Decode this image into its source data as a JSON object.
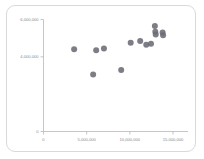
{
  "chart_data": {
    "type": "scatter",
    "title": "",
    "xlabel": "",
    "ylabel": "",
    "xlim": [
      0,
      16500000
    ],
    "ylim": [
      0,
      6000000
    ],
    "grid": false,
    "legend": null,
    "xticks": [
      {
        "value": 0,
        "label": "0"
      },
      {
        "value": 5000000,
        "label": "5,000,000"
      },
      {
        "value": 10000000,
        "label": "10,000,000"
      },
      {
        "value": 15000000,
        "label": "15,000,000"
      }
    ],
    "yticks": [
      {
        "value": 0,
        "label": "0"
      },
      {
        "value": 4000000,
        "label": "4,000,000"
      },
      {
        "value": 6000000,
        "label": "6,000,000"
      }
    ],
    "series": [
      {
        "name": "series-1",
        "marker": "circle",
        "color": "#6b6b75",
        "points": [
          {
            "x": 3550000,
            "y": 4400000
          },
          {
            "x": 6100000,
            "y": 4350000
          },
          {
            "x": 7000000,
            "y": 4450000
          },
          {
            "x": 5750000,
            "y": 3050000
          },
          {
            "x": 9000000,
            "y": 3300000
          },
          {
            "x": 10100000,
            "y": 4750000
          },
          {
            "x": 11200000,
            "y": 4850000
          },
          {
            "x": 11900000,
            "y": 4650000
          },
          {
            "x": 12450000,
            "y": 4700000
          },
          {
            "x": 12900000,
            "y": 5650000
          },
          {
            "x": 12950000,
            "y": 5350000
          },
          {
            "x": 13000000,
            "y": 5200000
          },
          {
            "x": 13800000,
            "y": 5300000
          },
          {
            "x": 13850000,
            "y": 5150000
          }
        ]
      }
    ]
  },
  "marker": {
    "radius": "3.0",
    "color": "#6b6b75"
  },
  "axes": {
    "x_axis_name": "x-axis",
    "y_axis_name": "y-axis"
  }
}
